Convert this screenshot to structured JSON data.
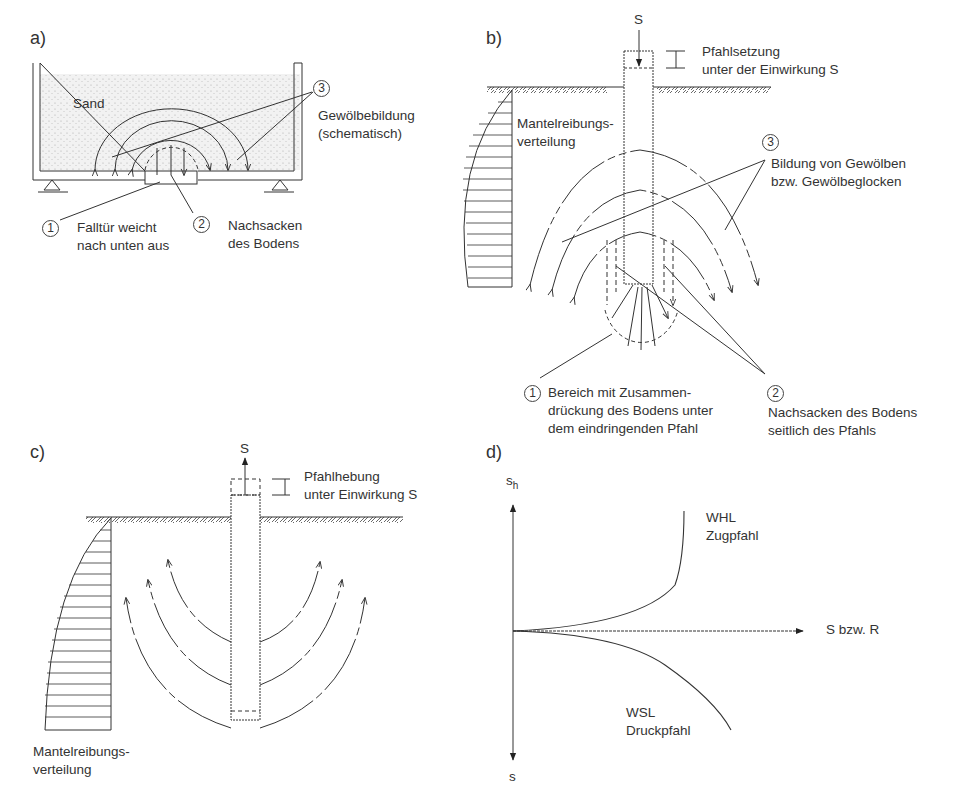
{
  "figure": {
    "panels": [
      {
        "id": "a",
        "label": "a)",
        "texts": {
          "material": "Sand",
          "callout_3": "3",
          "callout_3_text_1": "Gewölbebildung",
          "callout_3_text_2": "(schematisch)",
          "callout_1": "1",
          "callout_1_text_1": "Falltür weicht",
          "callout_1_text_2": "nach unten aus",
          "callout_2": "2",
          "callout_2_text_1": "Nachsacken",
          "callout_2_text_2": "des Bodens"
        }
      },
      {
        "id": "b",
        "label": "b)",
        "texts": {
          "load": "S",
          "settlement_1": "Pfahlsetzung",
          "settlement_2": "unter der Einwirkung S",
          "friction_1": "Mantelreibungs-",
          "friction_2": "verteilung",
          "callout_3": "3",
          "callout_3_text_1": "Bildung von Gewölben",
          "callout_3_text_2": "bzw. Gewölbeglocken",
          "callout_1": "1",
          "callout_1_text_1": "Bereich mit Zusammen-",
          "callout_1_text_2": "drückung des Bodens unter",
          "callout_1_text_3": "dem eindringenden Pfahl",
          "callout_2": "2",
          "callout_2_text_1": "Nachsacken des Bodens",
          "callout_2_text_2": "seitlich des Pfahls"
        }
      },
      {
        "id": "c",
        "label": "c)",
        "texts": {
          "load": "S",
          "heave_1": "Pfahlhebung",
          "heave_2": "unter Einwirkung S",
          "friction_1": "Mantelreibungs-",
          "friction_2": "verteilung"
        }
      },
      {
        "id": "d",
        "label": "d)",
        "texts": {
          "y_up": "s",
          "y_up_sub": "h",
          "y_down": "s",
          "x_axis": "S bzw. R",
          "curve_up_1": "WHL",
          "curve_up_2": "Zugpfahl",
          "curve_down_1": "WSL",
          "curve_down_2": "Druckpfahl"
        }
      }
    ],
    "colors": {
      "ink": "#2a2a2a",
      "background": "#ffffff",
      "sand": "#e6e6e6"
    }
  }
}
